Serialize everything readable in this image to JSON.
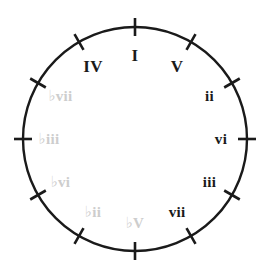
{
  "diagram": {
    "kind": "circle-of-fifths-roman-numerals",
    "circle": {
      "center_x": 135,
      "center_y": 139,
      "radius": 112,
      "stroke_color": "#1a1a1a",
      "stroke_width": 2.4,
      "fill": "none"
    },
    "tick": {
      "count": 12,
      "step_degrees": 30,
      "inner_offset": 9,
      "outer_offset": 9,
      "stroke_color": "#1a1a1a",
      "stroke_width": 2.6
    },
    "colors": {
      "diatonic_label": "#1a1a1a",
      "chromatic_label": "#cdcdcd",
      "background": "#ffffff"
    },
    "labels": [
      {
        "text": "I",
        "angle_degrees": 0,
        "style": "major",
        "label_radius": 84,
        "clock_position": "12"
      },
      {
        "text": "V",
        "angle_degrees": 30,
        "style": "major",
        "label_radius": 84,
        "clock_position": "1"
      },
      {
        "text": "ii",
        "angle_degrees": 60,
        "style": "minor",
        "label_radius": 86,
        "clock_position": "2"
      },
      {
        "text": "vi",
        "angle_degrees": 90,
        "style": "minor",
        "label_radius": 86,
        "clock_position": "3"
      },
      {
        "text": "iii",
        "angle_degrees": 120,
        "style": "minor",
        "label_radius": 86,
        "clock_position": "4"
      },
      {
        "text": "vii",
        "angle_degrees": 150,
        "style": "minor",
        "label_radius": 84,
        "clock_position": "5"
      },
      {
        "text": "♭V",
        "angle_degrees": 180,
        "style": "chromatic",
        "label_radius": 84,
        "clock_position": "6"
      },
      {
        "text": "♭ii",
        "angle_degrees": 210,
        "style": "chromatic",
        "label_radius": 84,
        "clock_position": "7"
      },
      {
        "text": "♭vi",
        "angle_degrees": 240,
        "style": "chromatic",
        "label_radius": 86,
        "clock_position": "8"
      },
      {
        "text": "♭iii",
        "angle_degrees": 270,
        "style": "chromatic",
        "label_radius": 86,
        "clock_position": "9"
      },
      {
        "text": "♭vii",
        "angle_degrees": 300,
        "style": "chromatic",
        "label_radius": 86,
        "clock_position": "10"
      },
      {
        "text": "IV",
        "angle_degrees": 330,
        "style": "major",
        "label_radius": 84,
        "clock_position": "11"
      }
    ]
  }
}
